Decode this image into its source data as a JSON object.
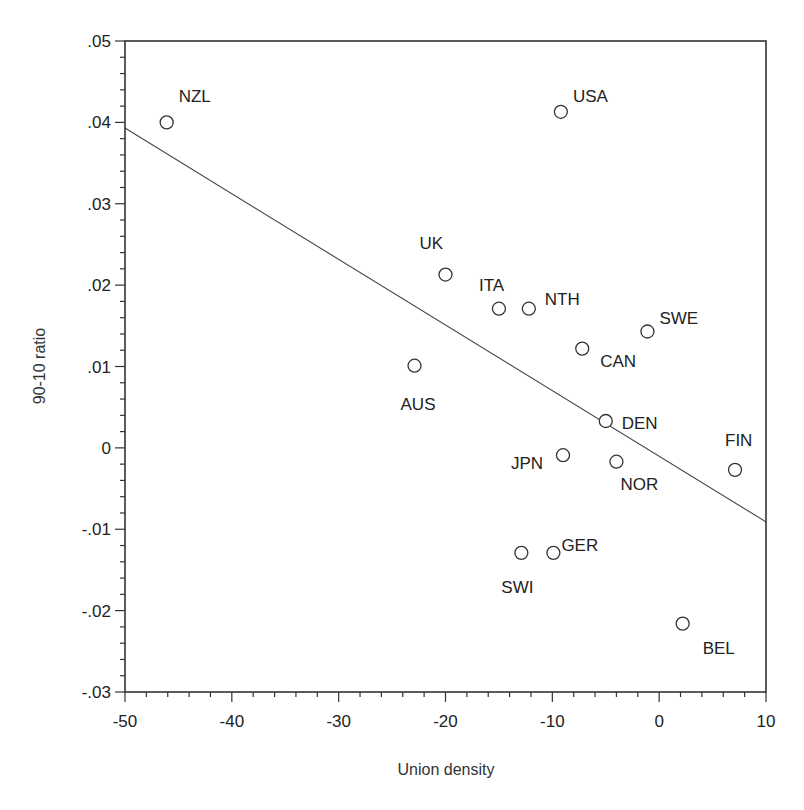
{
  "chart_data": {
    "type": "scatter",
    "title": "",
    "xlabel": "Union density",
    "ylabel": "90-10 ratio",
    "xlim": [
      -50,
      10
    ],
    "ylim": [
      -0.03,
      0.05
    ],
    "x_ticks": [
      -50,
      -40,
      -30,
      -20,
      -10,
      0,
      10
    ],
    "x_tick_labels": [
      "-50",
      "-40",
      "-30",
      "-20",
      "-10",
      "0",
      "10"
    ],
    "y_ticks": [
      0.05,
      0.04,
      0.03,
      0.02,
      0.01,
      0,
      -0.01,
      -0.02,
      -0.03
    ],
    "y_tick_labels": [
      ".05",
      ".04",
      ".03",
      ".02",
      ".01",
      "0",
      "-.01",
      "-.02",
      "-.03"
    ],
    "grid": false,
    "legend": null,
    "marker": "hollow-circle",
    "points": [
      {
        "label": "NZL",
        "x": -46.1,
        "y": 0.04,
        "lx": 12,
        "ly": -20
      },
      {
        "label": "USA",
        "x": -9.2,
        "y": 0.0413,
        "lx": 12,
        "ly": -10
      },
      {
        "label": "UK",
        "x": -20.0,
        "y": 0.0213,
        "lx": -26,
        "ly": -26
      },
      {
        "label": "ITA",
        "x": -15.0,
        "y": 0.0171,
        "lx": -20,
        "ly": -18
      },
      {
        "label": "NTH",
        "x": -12.2,
        "y": 0.0171,
        "lx": 16,
        "ly": -4
      },
      {
        "label": "SWE",
        "x": -1.1,
        "y": 0.0143,
        "lx": 12,
        "ly": -8
      },
      {
        "label": "CAN",
        "x": -7.2,
        "y": 0.0122,
        "lx": 18,
        "ly": 18
      },
      {
        "label": "AUS",
        "x": -22.9,
        "y": 0.0101,
        "lx": -14,
        "ly": 44
      },
      {
        "label": "DEN",
        "x": -5.0,
        "y": 0.0033,
        "lx": 16,
        "ly": 8
      },
      {
        "label": "JPN",
        "x": -9.0,
        "y": -0.0009,
        "lx": -52,
        "ly": 14
      },
      {
        "label": "NOR",
        "x": -4.0,
        "y": -0.0017,
        "lx": 4,
        "ly": 28
      },
      {
        "label": "FIN",
        "x": 7.1,
        "y": -0.0027,
        "lx": -10,
        "ly": -24
      },
      {
        "label": "SWI",
        "x": -12.9,
        "y": -0.0129,
        "lx": -20,
        "ly": 40
      },
      {
        "label": "GER",
        "x": -9.9,
        "y": -0.0129,
        "lx": 8,
        "ly": -2
      },
      {
        "label": "BEL",
        "x": 2.2,
        "y": -0.0216,
        "lx": 20,
        "ly": 30
      }
    ],
    "fit_line": {
      "x": [
        -50,
        10
      ],
      "y": [
        0.0393,
        -0.0091
      ]
    }
  },
  "colors": {
    "axis": "#333333",
    "marker": "#333333",
    "line": "#444444",
    "background": "#ffffff"
  }
}
